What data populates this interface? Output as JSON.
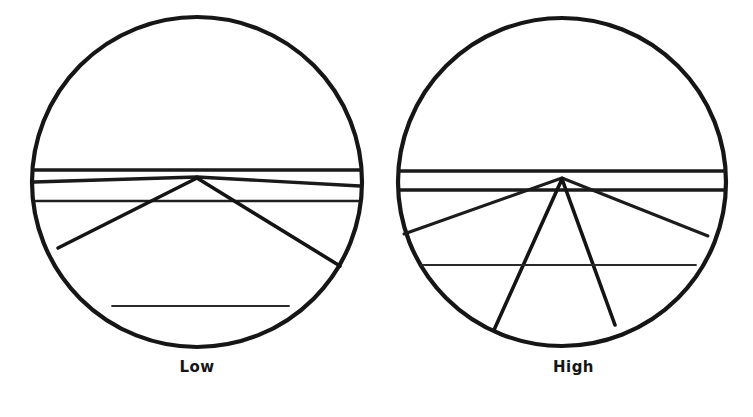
{
  "figure": {
    "background_color": "#ffffff",
    "ink_color": "#161616",
    "width": 753,
    "height": 417
  },
  "panels": [
    {
      "id": "low",
      "caption": "Low",
      "circle": {
        "cx": 197,
        "cy": 182,
        "r": 165
      },
      "vanishing_point": {
        "x": 197,
        "y": 177
      },
      "horizon_chord_count": 3,
      "ray_count": 4,
      "description": "Shallow fan of lines converging near the horizon"
    },
    {
      "id": "high",
      "caption": "High",
      "circle": {
        "cx": 562,
        "cy": 182,
        "r": 164
      },
      "vanishing_point": {
        "x": 562,
        "y": 176
      },
      "horizon_chord_count": 3,
      "ray_count": 4,
      "description": "Wide steep fan of lines radiating from the horizon point"
    }
  ],
  "captions": {
    "low": "Low",
    "high": "High"
  },
  "chart_data": {
    "type": "diagram",
    "categories": [
      "Low",
      "High"
    ],
    "series": [
      {
        "name": "ray_spread_degrees",
        "values": [
          27,
          96
        ]
      },
      {
        "name": "ray_count",
        "values": [
          4,
          4
        ]
      },
      {
        "name": "horizon_chords",
        "values": [
          3,
          3
        ]
      }
    ],
    "xlabel": "",
    "ylabel": "",
    "legend_position": "none",
    "grid": false
  }
}
